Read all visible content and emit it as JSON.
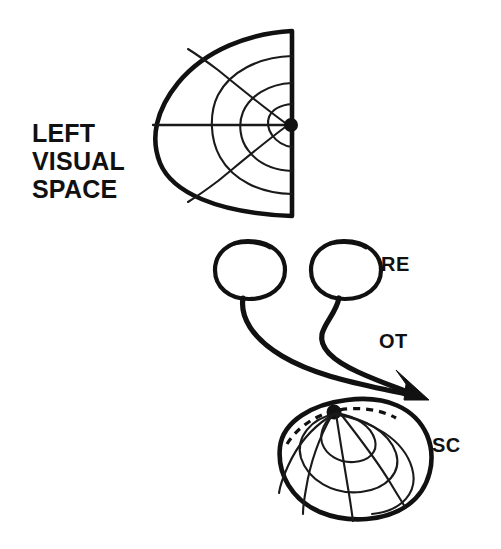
{
  "figure": {
    "background_color": "#ffffff",
    "ink_color": "#111111"
  },
  "labels": {
    "visual_space_line1": "LEFT",
    "visual_space_line2": "VISUAL",
    "visual_space_line3": "SPACE",
    "right_eye": "RE",
    "optic_tract": "OT",
    "superior_colliculus": "SC"
  },
  "visual_space": {
    "name": "left-visual-hemifield",
    "description": "Shield shaped hemifield with polar grid, vertical dashed meridian on the right edge and a fovea dot at the centre",
    "fovea_marker": "filled-dot",
    "vertical_meridian_style": "dashed",
    "horizontal_meridian_style": "solid",
    "eccentricity_arc_count": 3,
    "elevation_line_count": 2
  },
  "eyes": {
    "count": 2,
    "left_eye_name": "left-eye",
    "right_eye_name": "right-eye",
    "shape": "circle-with-lens-arc"
  },
  "optic_tract": {
    "path_count": 2,
    "terminus": "arrowhead-into-superior-colliculus"
  },
  "colliculus": {
    "name": "superior-colliculus",
    "description": "Ovoid dome carrying the collicular map with representation dot at the rostral pole and a dashed rim contour",
    "rim_style": "dashed",
    "pole_marker": "filled-dot",
    "meridian_count": 4,
    "isoeccentricity_count": 3
  }
}
